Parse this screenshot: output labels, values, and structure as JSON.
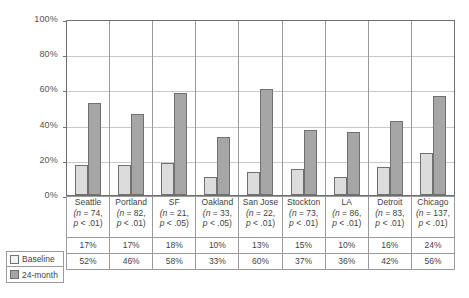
{
  "chart_data": {
    "type": "bar",
    "title": "",
    "xlabel": "",
    "ylabel": "",
    "ylim": [
      0,
      100
    ],
    "ytick_labels": [
      "100%",
      "80%",
      "60%",
      "40%",
      "20%",
      "0%"
    ],
    "ytick_values": [
      100,
      80,
      60,
      40,
      20,
      0
    ],
    "grid": true,
    "legend_position": "bottom-left",
    "categories": [
      "Seattle",
      "Portland",
      "SF",
      "Oakland",
      "San Jose",
      "Stockton",
      "LA",
      "Detroit",
      "Chicago"
    ],
    "series": [
      {
        "name": "Baseline",
        "color": "#dcdcdc",
        "values": [
          17,
          17,
          18,
          10,
          13,
          15,
          10,
          16,
          24
        ]
      },
      {
        "name": "24-month",
        "color": "#a6a6a6",
        "values": [
          52,
          46,
          58,
          33,
          60,
          37,
          36,
          42,
          56
        ]
      }
    ],
    "columns": [
      {
        "name": "Seattle",
        "n": "(n = 74,",
        "p": "p < .01)",
        "baseline": "17%",
        "month24": "52%"
      },
      {
        "name": "Portland",
        "n": "(n = 82,",
        "p": "p < .01)",
        "baseline": "17%",
        "month24": "46%"
      },
      {
        "name": "SF",
        "n": "(n = 21,",
        "p": "p < .05)",
        "baseline": "18%",
        "month24": "58%"
      },
      {
        "name": "Oakland",
        "n": "(n = 33,",
        "p": "p < .05)",
        "baseline": "10%",
        "month24": "33%"
      },
      {
        "name": "San Jose",
        "n": "(n = 22,",
        "p": "p < .01)",
        "baseline": "13%",
        "month24": "60%"
      },
      {
        "name": "Stockton",
        "n": "(n = 73,",
        "p": "p < .01)",
        "baseline": "15%",
        "month24": "37%"
      },
      {
        "name": "LA",
        "n": "(n = 86,",
        "p": "p < .01)",
        "baseline": "10%",
        "month24": "36%"
      },
      {
        "name": "Detroit",
        "n": "(n = 83,",
        "p": "p < .01)",
        "baseline": "16%",
        "month24": "42%"
      },
      {
        "name": "Chicago",
        "n": "(n = 137,",
        "p": "p < .01)",
        "baseline": "24%",
        "month24": "56%"
      }
    ]
  },
  "legend": {
    "rows": [
      {
        "label": "Baseline",
        "swatch": "baseline"
      },
      {
        "label": "24-month",
        "swatch": "month24"
      }
    ]
  }
}
